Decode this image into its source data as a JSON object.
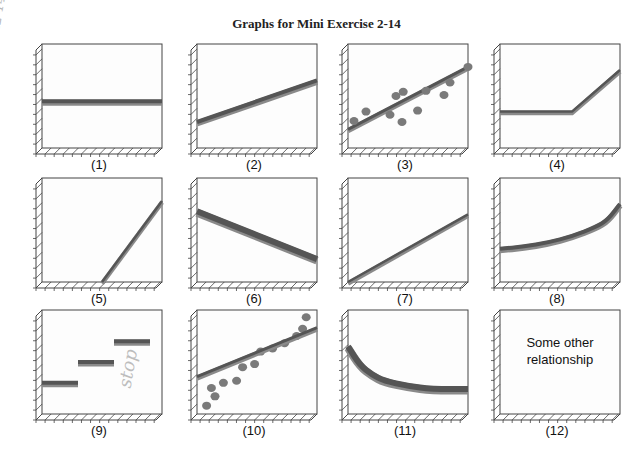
{
  "page": {
    "title": "Graphs for Mini Exercise 2-14",
    "margin_note": "M2-14 cont.",
    "handwritten_note_panel9": "stop"
  },
  "chart_data": [
    {
      "id": 1,
      "label": "(1)",
      "type": "line",
      "description": "horizontal line (no relationship / constant)",
      "x": [
        0,
        10
      ],
      "y": [
        4.5,
        4.5
      ],
      "ylim": [
        0,
        10
      ],
      "xlim": [
        0,
        10
      ],
      "grid": false
    },
    {
      "id": 2,
      "label": "(2)",
      "type": "line",
      "description": "positive linear, nonzero intercept",
      "x": [
        0,
        10
      ],
      "y": [
        2.5,
        6.5
      ],
      "ylim": [
        0,
        10
      ],
      "xlim": [
        0,
        10
      ]
    },
    {
      "id": 3,
      "label": "(3)",
      "type": "scatter",
      "description": "scatter points with positive linear trend line",
      "x": [
        0.5,
        1.5,
        3.5,
        4,
        4.6,
        4.5,
        5.8,
        6.5,
        8,
        8.5,
        10
      ],
      "y": [
        2.6,
        3.5,
        3.2,
        5,
        5.4,
        2.5,
        3.6,
        5.5,
        5.1,
        6.3,
        7.8
      ],
      "trend": {
        "x": [
          0,
          10
        ],
        "y": [
          1.8,
          7.8
        ]
      },
      "ylim": [
        0,
        10
      ],
      "xlim": [
        0,
        10
      ]
    },
    {
      "id": 4,
      "label": "(4)",
      "type": "line",
      "description": "flat then increasing (kinked line)",
      "x": [
        0,
        6,
        10
      ],
      "y": [
        3.5,
        3.5,
        7.5
      ],
      "ylim": [
        0,
        10
      ],
      "xlim": [
        0,
        10
      ]
    },
    {
      "id": 5,
      "label": "(5)",
      "type": "line",
      "description": "steep positive line starting at mid x-axis",
      "x": [
        5,
        10
      ],
      "y": [
        0,
        7.8
      ],
      "ylim": [
        0,
        10
      ],
      "xlim": [
        0,
        10
      ]
    },
    {
      "id": 6,
      "label": "(6)",
      "type": "line",
      "description": "negative linear",
      "x": [
        0,
        10
      ],
      "y": [
        6.8,
        2.2
      ],
      "ylim": [
        0,
        10
      ],
      "xlim": [
        0,
        10
      ]
    },
    {
      "id": 7,
      "label": "(7)",
      "type": "line",
      "description": "positive linear through origin (proportional)",
      "x": [
        0,
        10
      ],
      "y": [
        0,
        6.5
      ],
      "ylim": [
        0,
        10
      ],
      "xlim": [
        0,
        10
      ]
    },
    {
      "id": 8,
      "label": "(8)",
      "type": "line",
      "description": "increasing convex curve (exponential-like)",
      "x": [
        0,
        2,
        4,
        6,
        8,
        9,
        10
      ],
      "y": [
        3.2,
        3.4,
        3.8,
        4.4,
        5.3,
        6.0,
        7.5
      ],
      "ylim": [
        0,
        10
      ],
      "xlim": [
        0,
        10
      ]
    },
    {
      "id": 9,
      "label": "(9)",
      "type": "line",
      "description": "step function (three flat segments)",
      "segments": [
        {
          "x": [
            0,
            3
          ],
          "y": [
            3,
            3
          ]
        },
        {
          "x": [
            3,
            6
          ],
          "y": [
            5,
            5
          ]
        },
        {
          "x": [
            6,
            9
          ],
          "y": [
            7,
            7
          ]
        }
      ],
      "ylim": [
        0,
        10
      ],
      "xlim": [
        0,
        10
      ]
    },
    {
      "id": 10,
      "label": "(10)",
      "type": "scatter",
      "description": "curvilinear scatter with linear fit line",
      "x": [
        0.8,
        1.2,
        1.5,
        2.2,
        3.3,
        3.8,
        4.8,
        5.3,
        6.3,
        7.3,
        8.3,
        8.8,
        9.1
      ],
      "y": [
        0.8,
        2.5,
        1.7,
        3.0,
        3.2,
        4.5,
        4.8,
        6.0,
        6.3,
        6.8,
        7.5,
        8.2,
        9.3
      ],
      "trend": {
        "x": [
          0,
          10
        ],
        "y": [
          3.6,
          8.3
        ]
      },
      "ylim": [
        0,
        10
      ],
      "xlim": [
        0,
        10
      ]
    },
    {
      "id": 11,
      "label": "(11)",
      "type": "line",
      "description": "decreasing convex curve leveling off",
      "x": [
        0,
        1,
        2,
        3,
        5,
        7,
        10
      ],
      "y": [
        6.5,
        4.7,
        3.8,
        3.2,
        2.7,
        2.4,
        2.4
      ],
      "ylim": [
        0,
        10
      ],
      "xlim": [
        0,
        10
      ]
    },
    {
      "id": 12,
      "label": "(12)",
      "type": "text",
      "description": "empty axes with text",
      "text": "Some other relationship"
    }
  ],
  "panels": {
    "p1": {
      "label": "(1)"
    },
    "p2": {
      "label": "(2)"
    },
    "p3": {
      "label": "(3)"
    },
    "p4": {
      "label": "(4)"
    },
    "p5": {
      "label": "(5)"
    },
    "p6": {
      "label": "(6)"
    },
    "p7": {
      "label": "(7)"
    },
    "p8": {
      "label": "(8)"
    },
    "p9": {
      "label": "(9)"
    },
    "p10": {
      "label": "(10)"
    },
    "p11": {
      "label": "(11)"
    },
    "p12": {
      "label": "(12)"
    },
    "p12_text_line1": "Some other",
    "p12_text_line2": "relationship"
  },
  "colors": {
    "line_dark": "#555555",
    "line_light": "#8a8a8a",
    "dot": "#7a7a7a",
    "axis": "#444444"
  }
}
